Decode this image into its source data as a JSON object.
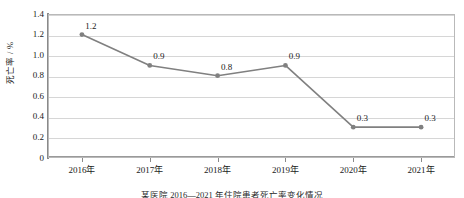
{
  "chart_data": {
    "type": "line",
    "title": "",
    "xlabel": "",
    "ylabel": "死亡率 / %",
    "categories": [
      "2016年",
      "2017年",
      "2018年",
      "2019年",
      "2020年",
      "2021年"
    ],
    "values": [
      1.2,
      0.9,
      0.8,
      0.9,
      0.3,
      0.3
    ],
    "point_labels": [
      "1.2",
      "0.9",
      "0.8",
      "0.9",
      "0.3",
      "0.3"
    ],
    "series": [
      {
        "name": "死亡率",
        "values": [
          1.2,
          0.9,
          0.8,
          0.9,
          0.3,
          0.3
        ]
      }
    ],
    "ylim": [
      0,
      1.4
    ],
    "y_ticks": [
      0,
      0.2,
      0.4,
      0.6,
      0.8,
      1.0,
      1.2,
      1.4
    ],
    "y_tick_labels": [
      "0",
      "0.2",
      "0.4",
      "0.6",
      "0.8",
      "1.0",
      "1.2",
      "1.4"
    ],
    "grid": "horizontal",
    "legend": "none",
    "line_color": "#808080",
    "marker_color": "#808080",
    "marker_shape": "circle",
    "gridline_color": "#d6d6d6",
    "plot_border_color": "#b9b9b9",
    "text_color": "#1a1a1a"
  },
  "caption": {
    "text": "某医院 2016—2021 年住院患者死亡率变化情况"
  }
}
